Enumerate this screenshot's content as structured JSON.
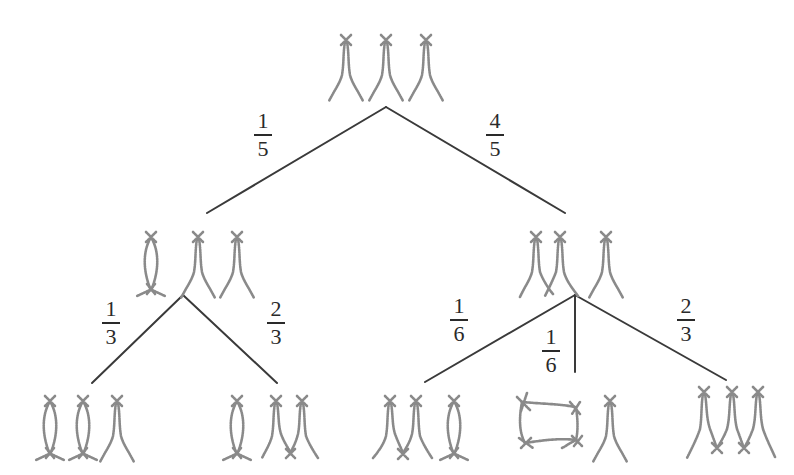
{
  "diagram": {
    "type": "probability-tree",
    "root": {
      "label": "three separate chromosome-like loops (X shapes)",
      "components": 3
    },
    "branches": {
      "root_left": {
        "numerator": "1",
        "denominator": "5"
      },
      "root_right": {
        "numerator": "4",
        "denominator": "5"
      },
      "left_left": {
        "numerator": "1",
        "denominator": "3"
      },
      "left_right": {
        "numerator": "2",
        "denominator": "3"
      },
      "right_left": {
        "numerator": "1",
        "denominator": "6"
      },
      "right_middle": {
        "numerator": "1",
        "denominator": "6"
      },
      "right_right": {
        "numerator": "2",
        "denominator": "3"
      }
    },
    "level1": [
      {
        "id": "L",
        "description": "one self-closed loop + two open arcs"
      },
      {
        "id": "R",
        "description": "two arcs joined + one open arc"
      }
    ],
    "level2": [
      {
        "id": "LL",
        "description": "two self-closed loops + one open arc"
      },
      {
        "id": "LR",
        "description": "one self-closed loop + two joined arcs"
      },
      {
        "id": "RL",
        "description": "two joined arcs + one self-closed loop"
      },
      {
        "id": "RM",
        "description": "one large closed loop + one open arc"
      },
      {
        "id": "RR",
        "description": "three arcs joined in a chain"
      }
    ]
  },
  "colors": {
    "edge": "#3a3a3a",
    "chromosome": "#8a8a8a",
    "text": "#2a2a2a",
    "background": "#ffffff"
  }
}
